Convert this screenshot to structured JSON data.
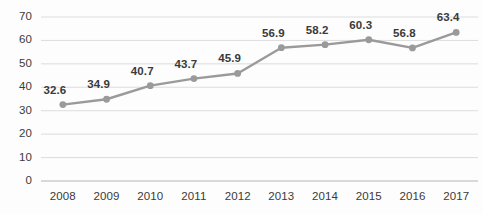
{
  "chart_data": {
    "type": "line",
    "title": "",
    "subtitle": "",
    "xlabel": "",
    "ylabel": "",
    "categories": [
      "2008",
      "2009",
      "2010",
      "2011",
      "2012",
      "2013",
      "2014",
      "2015",
      "2016",
      "2017"
    ],
    "values": [
      32.6,
      34.9,
      40.7,
      43.7,
      45.9,
      56.9,
      58.2,
      60.3,
      56.8,
      63.4
    ],
    "point_labels": [
      "32.6",
      "34.9",
      "40.7",
      "43.7",
      "45.9",
      "56.9",
      "58.2",
      "60.3",
      "56.8",
      "63.4"
    ],
    "ylim": [
      0,
      70
    ],
    "ytick_values": [
      0,
      10,
      20,
      30,
      40,
      50,
      60,
      70
    ],
    "ytick_labels": [
      "0",
      "10",
      "20",
      "30",
      "40",
      "50",
      "60",
      "70"
    ],
    "grid": true,
    "grid_axis": "y",
    "legend": false,
    "legend_position": "none",
    "series": [
      {
        "name": "",
        "values": [
          32.6,
          34.9,
          40.7,
          43.7,
          45.9,
          56.9,
          58.2,
          60.3,
          56.8,
          63.4
        ]
      }
    ],
    "colors": {
      "line": "#9a9a9a",
      "marker": "#9a9a9a",
      "grid": "#d9d9d9",
      "axis": "#b5b5b5",
      "text": "#3a3a3a",
      "background": "#fdfdfd"
    }
  }
}
